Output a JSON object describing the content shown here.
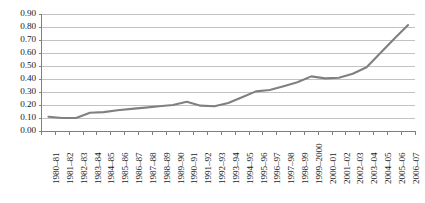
{
  "chart_data": {
    "type": "line",
    "title": "",
    "subtitle": "",
    "xlabel": "",
    "ylabel": "",
    "grid": true,
    "legend": false,
    "legend_position": "none",
    "line_color": "#808080",
    "gridline_color": "#b3b3b3",
    "axis_color": "#808080",
    "text_color": "#1a1a1a",
    "ylim": [
      0.0,
      0.9
    ],
    "ytick_labels": [
      "0.90",
      "0.80",
      "0.70",
      "0.60",
      "0.50",
      "0.40",
      "0.30",
      "0.20",
      "0.10",
      "0.00"
    ],
    "ytick_values": [
      0.9,
      0.8,
      0.7,
      0.6,
      0.5,
      0.4,
      0.3,
      0.2,
      0.1,
      0.0
    ],
    "categories": [
      "1980–81",
      "1981–82",
      "1982–83",
      "1983–84",
      "1984–85",
      "1985–86",
      "1986–87",
      "1987–88",
      "1988–89",
      "1989–90",
      "1990–91",
      "1991–92",
      "1992–93",
      "1993–94",
      "1994–95",
      "1995–96",
      "1996–97",
      "1997–98",
      "1998–99",
      "1999–2000",
      "2000–01",
      "2001–02",
      "2002–03",
      "2003–04",
      "2004–05",
      "2005–06",
      "2006–07"
    ],
    "values": [
      0.11,
      0.1,
      0.1,
      0.14,
      0.145,
      0.16,
      0.17,
      0.18,
      0.19,
      0.2,
      0.225,
      0.195,
      0.19,
      0.215,
      0.26,
      0.305,
      0.315,
      0.345,
      0.375,
      0.42,
      0.405,
      0.41,
      0.44,
      0.49,
      0.6,
      0.71,
      0.815
    ]
  }
}
